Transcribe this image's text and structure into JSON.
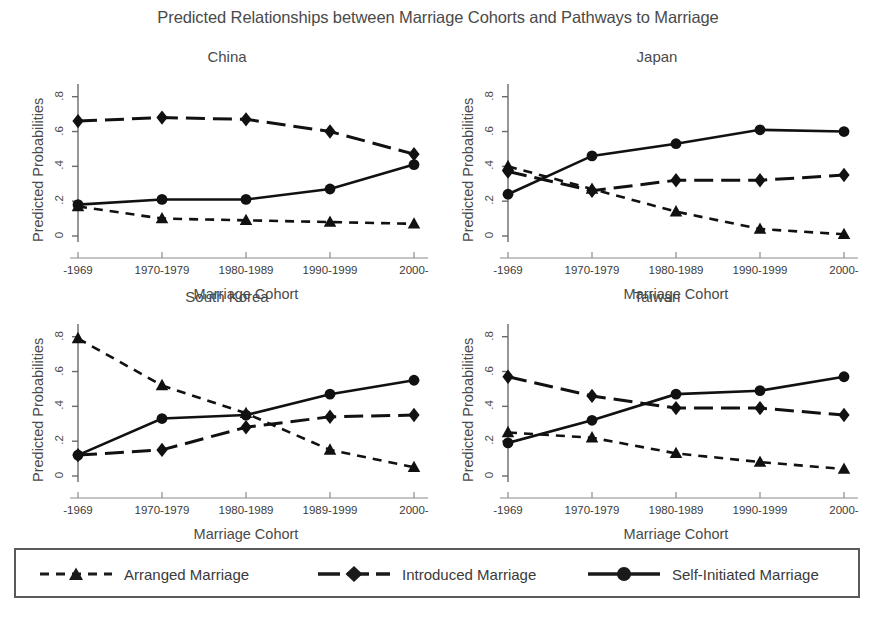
{
  "title": "Predicted Relationships between Marriage Cohorts and Pathways to Marriage",
  "axis": {
    "ylabel": "Predicted Probabilities",
    "xlabel": "Marriage Cohort",
    "yticks": [
      "0",
      ".2",
      ".4",
      ".6",
      ".8"
    ],
    "ytick_values": [
      0,
      0.2,
      0.4,
      0.6,
      0.8
    ],
    "ylim": [
      0,
      0.85
    ]
  },
  "legend": {
    "items": [
      {
        "label": "Arranged Marriage",
        "marker": "triangle",
        "dash": "short-dash"
      },
      {
        "label": "Introduced Marriage",
        "marker": "diamond",
        "dash": "long-dash"
      },
      {
        "label": "Self-Initiated Marriage",
        "marker": "circle",
        "dash": "solid"
      }
    ]
  },
  "chart_data": {
    "type": "line",
    "title": "Predicted Relationships between Marriage Cohorts and Pathways to Marriage",
    "xlabel": "Marriage Cohort",
    "ylabel": "Predicted Probabilities",
    "ylim": [
      0,
      0.85
    ],
    "yticks": [
      0,
      0.2,
      0.4,
      0.6,
      0.8
    ],
    "grid": false,
    "legend_position": "bottom",
    "panels": [
      {
        "title": "China",
        "categories": [
          "-1969",
          "1970-1979",
          "1980-1989",
          "1990-1999",
          "2000-"
        ],
        "series": [
          {
            "name": "Arranged Marriage",
            "marker": "triangle",
            "dash": "short-dash",
            "values": [
              0.17,
              0.1,
              0.09,
              0.08,
              0.07
            ]
          },
          {
            "name": "Introduced Marriage",
            "marker": "diamond",
            "dash": "long-dash",
            "values": [
              0.66,
              0.68,
              0.67,
              0.6,
              0.47
            ]
          },
          {
            "name": "Self-Initiated Marriage",
            "marker": "circle",
            "dash": "solid",
            "values": [
              0.18,
              0.21,
              0.21,
              0.27,
              0.41
            ]
          }
        ]
      },
      {
        "title": "Japan",
        "categories": [
          "-1969",
          "1970-1979",
          "1980-1989",
          "1990-1999",
          "2000-"
        ],
        "series": [
          {
            "name": "Arranged Marriage",
            "marker": "triangle",
            "dash": "short-dash",
            "values": [
              0.4,
              0.27,
              0.14,
              0.04,
              0.01
            ]
          },
          {
            "name": "Introduced Marriage",
            "marker": "diamond",
            "dash": "long-dash",
            "values": [
              0.37,
              0.26,
              0.32,
              0.32,
              0.35
            ]
          },
          {
            "name": "Self-Initiated Marriage",
            "marker": "circle",
            "dash": "solid",
            "values": [
              0.24,
              0.46,
              0.53,
              0.61,
              0.6
            ]
          }
        ]
      },
      {
        "title": "South Korea",
        "categories": [
          "-1969",
          "1970-1979",
          "1980-1989",
          "1989-1999",
          "2000-"
        ],
        "series": [
          {
            "name": "Arranged Marriage",
            "marker": "triangle",
            "dash": "short-dash",
            "values": [
              0.79,
              0.52,
              0.36,
              0.15,
              0.05
            ]
          },
          {
            "name": "Introduced Marriage",
            "marker": "diamond",
            "dash": "long-dash",
            "values": [
              0.12,
              0.15,
              0.28,
              0.34,
              0.35
            ]
          },
          {
            "name": "Self-Initiated Marriage",
            "marker": "circle",
            "dash": "solid",
            "values": [
              0.12,
              0.33,
              0.35,
              0.47,
              0.55
            ]
          }
        ]
      },
      {
        "title": "Taiwan",
        "categories": [
          "-1969",
          "1970-1979",
          "1980-1989",
          "1990-1999",
          "2000-"
        ],
        "series": [
          {
            "name": "Arranged Marriage",
            "marker": "triangle",
            "dash": "short-dash",
            "values": [
              0.25,
              0.22,
              0.13,
              0.08,
              0.04
            ]
          },
          {
            "name": "Introduced Marriage",
            "marker": "diamond",
            "dash": "long-dash",
            "values": [
              0.57,
              0.46,
              0.39,
              0.39,
              0.35
            ]
          },
          {
            "name": "Self-Initiated Marriage",
            "marker": "circle",
            "dash": "solid",
            "values": [
              0.19,
              0.32,
              0.47,
              0.49,
              0.57
            ]
          }
        ]
      }
    ]
  }
}
